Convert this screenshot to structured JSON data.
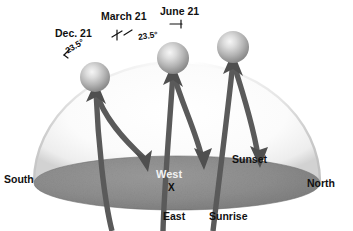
{
  "diagram": {
    "type": "solar-path-dome",
    "colors": {
      "background": "#ffffff",
      "dome_fill": "#f4f4f4",
      "dome_edge": "#c9c9c9",
      "ground_fill": "#8c8c8c",
      "ground_edge": "#6e6e6e",
      "arc_stroke": "#595959",
      "sun_light": "#f0f0f0",
      "sun_mid": "#bdbdbd",
      "sun_dark": "#8f8f8f",
      "text_dark": "#111111",
      "text_light": "#f2f2f2"
    },
    "date_labels": [
      {
        "id": "dec",
        "text": "Dec. 21"
      },
      {
        "id": "mar",
        "text": "March 21"
      },
      {
        "id": "jun",
        "text": "June 21"
      }
    ],
    "angle_labels": [
      {
        "id": "ang-dec",
        "text": "23.5°"
      },
      {
        "id": "ang-mar",
        "text": "23.5°"
      }
    ],
    "cardinal_labels": [
      {
        "id": "south",
        "text": "South"
      },
      {
        "id": "north",
        "text": "North"
      },
      {
        "id": "west",
        "text": "West"
      },
      {
        "id": "east",
        "text": "East"
      }
    ],
    "event_labels": [
      {
        "id": "sunrise",
        "text": "Sunrise"
      },
      {
        "id": "sunset",
        "text": "Sunset"
      }
    ],
    "observer_marker": "X",
    "suns": [
      {
        "id": "sun-dec",
        "cx": 95,
        "cy": 77,
        "r": 15
      },
      {
        "id": "sun-mar",
        "cx": 173,
        "cy": 58,
        "r": 16
      },
      {
        "id": "sun-jun",
        "cx": 233,
        "cy": 47,
        "r": 16
      }
    ],
    "paths": [
      {
        "id": "path-dec",
        "label": "Dec. 21",
        "rise_x": 95,
        "set_x": 148,
        "apex_y": 84
      },
      {
        "id": "path-mar",
        "label": "March 21",
        "rise_x": 173,
        "set_x": 203,
        "apex_y": 66
      },
      {
        "id": "path-jun",
        "label": "June 21",
        "rise_x": 233,
        "set_x": 258,
        "apex_y": 54
      }
    ]
  }
}
